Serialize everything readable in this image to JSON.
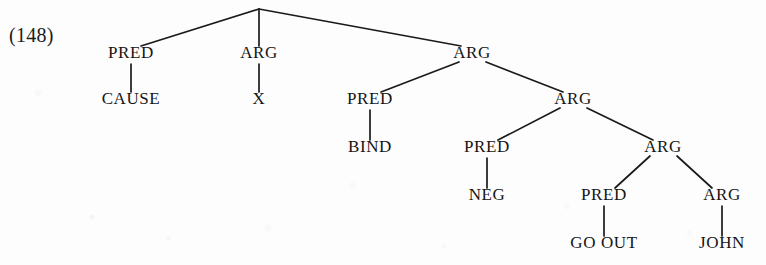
{
  "figure": {
    "example_number": "(148)",
    "type": "constituency-tree",
    "ink_color": "#151515",
    "background_color": "#fdfdfd"
  },
  "tree": {
    "root": {
      "id": "root",
      "label": "",
      "x": 259,
      "y": 9
    },
    "nodes": [
      {
        "id": "n-pred-cause",
        "label": "PRED",
        "x": 131,
        "y": 58,
        "depth": 1
      },
      {
        "id": "n-arg-x",
        "label": "ARG",
        "x": 259,
        "y": 58,
        "depth": 1
      },
      {
        "id": "n-arg-1",
        "label": "ARG",
        "x": 472,
        "y": 58,
        "depth": 1
      },
      {
        "id": "l-cause",
        "label": "CAUSE",
        "x": 131,
        "y": 104,
        "depth": 2
      },
      {
        "id": "l-x",
        "label": "X",
        "x": 259,
        "y": 104,
        "depth": 2
      },
      {
        "id": "n-pred-bind",
        "label": "PRED",
        "x": 370,
        "y": 104,
        "depth": 2
      },
      {
        "id": "n-arg-2",
        "label": "ARG",
        "x": 573,
        "y": 104,
        "depth": 2
      },
      {
        "id": "l-bind",
        "label": "BIND",
        "x": 370,
        "y": 152,
        "depth": 3
      },
      {
        "id": "n-pred-neg",
        "label": "PRED",
        "x": 487,
        "y": 152,
        "depth": 3
      },
      {
        "id": "n-arg-3",
        "label": "ARG",
        "x": 663,
        "y": 152,
        "depth": 3
      },
      {
        "id": "l-neg",
        "label": "NEG",
        "x": 487,
        "y": 200,
        "depth": 4
      },
      {
        "id": "n-pred-goout",
        "label": "PRED",
        "x": 604,
        "y": 200,
        "depth": 4
      },
      {
        "id": "n-arg-john",
        "label": "ARG",
        "x": 722,
        "y": 200,
        "depth": 4
      },
      {
        "id": "l-goout",
        "label": "GO OUT",
        "x": 604,
        "y": 248,
        "depth": 5
      },
      {
        "id": "l-john",
        "label": "JOHN",
        "x": 722,
        "y": 248,
        "depth": 5
      }
    ],
    "edges": [
      {
        "from": "root",
        "to": "n-pred-cause",
        "x1": 259,
        "y1": 9,
        "x2": 141,
        "y2": 46
      },
      {
        "from": "root",
        "to": "n-arg-x",
        "x1": 259,
        "y1": 9,
        "x2": 259,
        "y2": 46
      },
      {
        "from": "root",
        "to": "n-arg-1",
        "x1": 259,
        "y1": 9,
        "x2": 461,
        "y2": 46
      },
      {
        "from": "n-pred-cause",
        "to": "l-cause",
        "x1": 131,
        "y1": 64,
        "x2": 131,
        "y2": 92
      },
      {
        "from": "n-arg-x",
        "to": "l-x",
        "x1": 259,
        "y1": 64,
        "x2": 259,
        "y2": 92
      },
      {
        "from": "n-arg-1",
        "to": "n-pred-bind",
        "x1": 459,
        "y1": 62,
        "x2": 381,
        "y2": 92
      },
      {
        "from": "n-arg-1",
        "to": "n-arg-2",
        "x1": 486,
        "y1": 62,
        "x2": 563,
        "y2": 92
      },
      {
        "from": "n-pred-bind",
        "to": "l-bind",
        "x1": 370,
        "y1": 110,
        "x2": 370,
        "y2": 140
      },
      {
        "from": "n-arg-2",
        "to": "n-pred-neg",
        "x1": 560,
        "y1": 108,
        "x2": 498,
        "y2": 140
      },
      {
        "from": "n-arg-2",
        "to": "n-arg-3",
        "x1": 587,
        "y1": 108,
        "x2": 653,
        "y2": 140
      },
      {
        "from": "n-pred-neg",
        "to": "l-neg",
        "x1": 487,
        "y1": 158,
        "x2": 487,
        "y2": 188
      },
      {
        "from": "n-arg-3",
        "to": "n-pred-goout",
        "x1": 650,
        "y1": 156,
        "x2": 615,
        "y2": 188
      },
      {
        "from": "n-arg-3",
        "to": "n-arg-john",
        "x1": 677,
        "y1": 156,
        "x2": 712,
        "y2": 188
      },
      {
        "from": "n-pred-goout",
        "to": "l-goout",
        "x1": 604,
        "y1": 206,
        "x2": 604,
        "y2": 236
      },
      {
        "from": "n-arg-john",
        "to": "l-john",
        "x1": 722,
        "y1": 206,
        "x2": 722,
        "y2": 236
      }
    ]
  }
}
